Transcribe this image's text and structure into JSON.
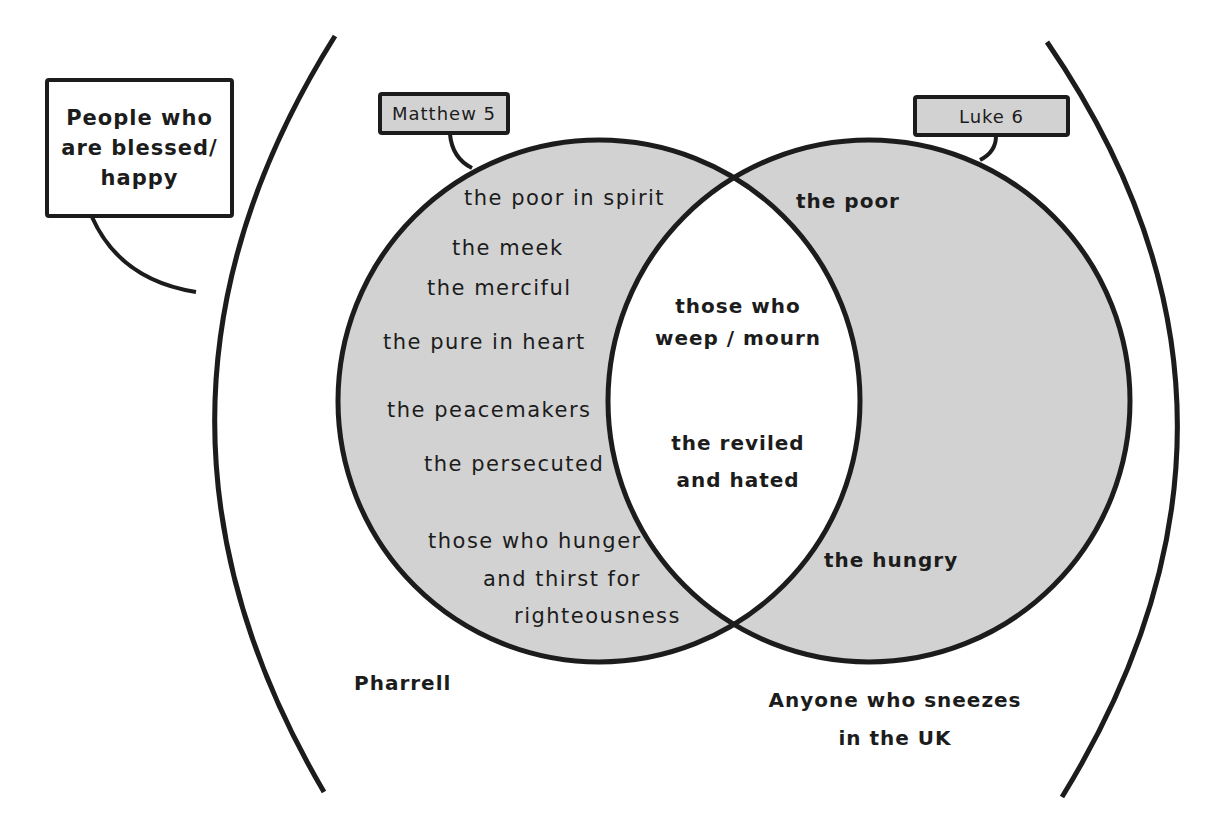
{
  "diagram": {
    "type": "venn",
    "colors": {
      "stroke": "#1c1c1c",
      "set_fill": "#d2d2d2",
      "intersection_fill": "#ffffff",
      "background": "#ffffff"
    },
    "universe": {
      "label_lines": [
        "People who",
        "are blessed/",
        "happy"
      ],
      "outside_items": {
        "left": "Pharrell",
        "right_line1": "Anyone who sneezes",
        "right_line2": "in the UK"
      }
    },
    "sets": {
      "left": {
        "label": "Matthew 5",
        "items": [
          "the poor in spirit",
          "the meek",
          "the merciful",
          "the pure in heart",
          "the peacemakers",
          "the persecuted",
          "those who hunger",
          "and thirst for",
          "righteousness"
        ]
      },
      "right": {
        "label": "Luke 6",
        "items": [
          "the poor",
          "the hungry"
        ]
      },
      "intersection": {
        "items": [
          "those who",
          "weep / mourn",
          "the reviled",
          "and hated"
        ]
      }
    }
  }
}
